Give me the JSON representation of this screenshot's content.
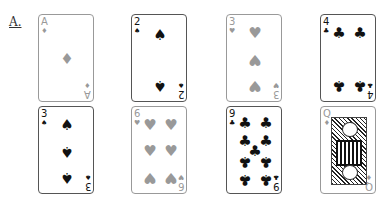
{
  "figure": {
    "label": "A.",
    "cards": [
      {
        "rank": "A",
        "suit": "diamonds",
        "symbol": "♦",
        "color": "gray",
        "row": 1,
        "col": 1
      },
      {
        "rank": "2",
        "suit": "spades",
        "symbol": "♠",
        "color": "black",
        "row": 1,
        "col": 2
      },
      {
        "rank": "3",
        "suit": "hearts",
        "symbol": "♥",
        "color": "gray",
        "row": 1,
        "col": 3
      },
      {
        "rank": "4",
        "suit": "clubs",
        "symbol": "♣",
        "color": "black",
        "row": 1,
        "col": 4
      },
      {
        "rank": "3",
        "suit": "spades",
        "symbol": "♠",
        "color": "black",
        "row": 2,
        "col": 1
      },
      {
        "rank": "6",
        "suit": "hearts",
        "symbol": "♥",
        "color": "gray",
        "row": 2,
        "col": 2
      },
      {
        "rank": "9",
        "suit": "clubs",
        "symbol": "♣",
        "color": "black",
        "row": 2,
        "col": 3
      },
      {
        "rank": "Q",
        "suit": "diamonds",
        "symbol": "♦",
        "color": "gray",
        "row": 2,
        "col": 4
      }
    ]
  }
}
